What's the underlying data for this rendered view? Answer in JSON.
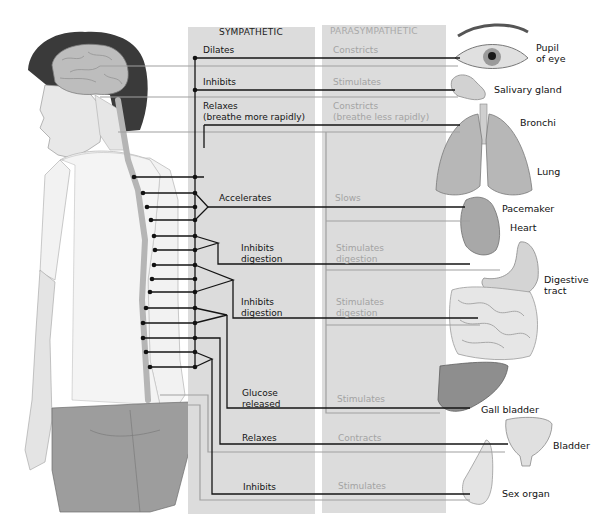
{
  "diagram": {
    "headers": {
      "sympathetic": "SYMPATHETIC",
      "parasympathetic": "PARASYMPATHETIC"
    },
    "effects": [
      {
        "organ": "Pupil\nof eye",
        "sympathetic": "Dilates",
        "parasympathetic": "Constricts"
      },
      {
        "organ": "Salivary gland",
        "sympathetic": "Inhibits",
        "parasympathetic": "Stimulates"
      },
      {
        "organ": "Bronchi",
        "sympathetic": "Relaxes\n(breathe more rapidly)",
        "parasympathetic": "Constricts\n(breathe less rapidly)"
      },
      {
        "organ": "Lung",
        "sympathetic": "",
        "parasympathetic": ""
      },
      {
        "organ": "Pacemaker",
        "sympathetic": "Accelerates",
        "parasympathetic": "Slows"
      },
      {
        "organ": "Heart",
        "sympathetic": "",
        "parasympathetic": ""
      },
      {
        "organ": "Digestive\ntract",
        "sympathetic": "Inhibits\ndigestion",
        "parasympathetic": "Stimulates\ndigestion"
      },
      {
        "organ": "",
        "sympathetic": "Inhibits\ndigestion",
        "parasympathetic": "Stimulates\ndigestion"
      },
      {
        "organ": "Gall bladder",
        "sympathetic": "Glucose\nreleased",
        "parasympathetic": "Stimulates"
      },
      {
        "organ": "Bladder",
        "sympathetic": "Relaxes",
        "parasympathetic": "Contracts"
      },
      {
        "organ": "Sex organ",
        "sympathetic": "Inhibits",
        "parasympathetic": "Stimulates"
      }
    ],
    "figure": {
      "subject": "human-figure-side-view",
      "features": [
        "brain",
        "spinal-cord",
        "sympathetic-chain-ganglia"
      ]
    },
    "colors": {
      "panel_bg": "#dcdcdc",
      "sympathetic_line": "#141414",
      "parasympathetic_line": "#a0a0a0",
      "parasympathetic_text": "#a3a3a3"
    }
  }
}
